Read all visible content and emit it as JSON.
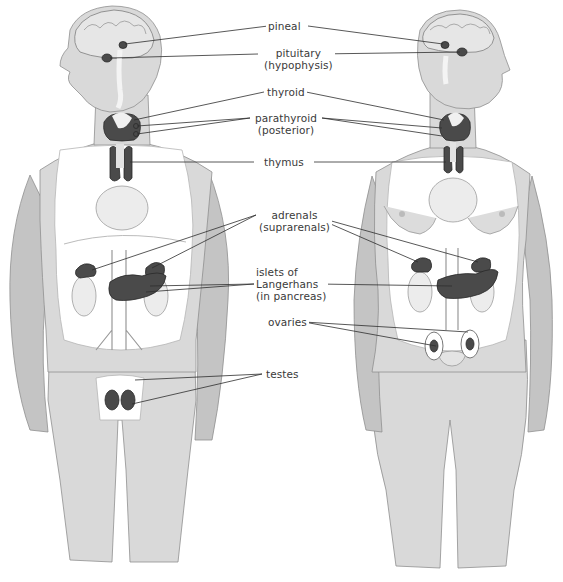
{
  "figure": {
    "figures": [
      "male",
      "female"
    ]
  },
  "labels": {
    "pineal": "pineal",
    "pituitary_1": "pituitary",
    "pituitary_2": "(hypophysis)",
    "thyroid": "thyroid",
    "parathyroid_1": "parathyroid",
    "parathyroid_2": "(posterior)",
    "thymus": "thymus",
    "adrenals_1": "adrenals",
    "adrenals_2": "(suprarenals)",
    "islets_1": "islets of",
    "islets_2": "Langerhans",
    "islets_3": "(in pancreas)",
    "ovaries": "ovaries",
    "testes": "testes"
  },
  "colors": {
    "background": "#ffffff",
    "skin": "#d9d9d9",
    "gland": "#4a4a4a",
    "leader_line": "#2d2d2d",
    "label_text": "#3a3a3a"
  }
}
